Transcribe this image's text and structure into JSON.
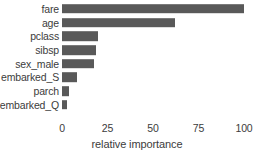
{
  "chart_data": {
    "type": "bar",
    "orientation": "horizontal",
    "title": "",
    "subtitle": "",
    "xlabel": "relative importance",
    "ylabel": "",
    "categories": [
      "fare",
      "age",
      "pclass",
      "sibsp",
      "sex_male",
      "embarked_S",
      "parch",
      "embarked_Q"
    ],
    "values": [
      100,
      62,
      20,
      18.5,
      17.5,
      8.5,
      4,
      3
    ],
    "series": [
      {
        "name": "relative importance",
        "values": [
          100,
          62,
          20,
          18.5,
          17.5,
          8.5,
          4,
          3
        ]
      }
    ],
    "xlim": [
      0,
      100
    ],
    "xticks": [
      0,
      25,
      50,
      75,
      100
    ],
    "xtick_labels": [
      "0",
      "25",
      "50",
      "75",
      "100"
    ],
    "grid": false,
    "legend": false,
    "legend_position": "none",
    "bar_color": "#595959",
    "text_color": "#3c3c3c",
    "background_color": "#ffffff",
    "annotations": []
  },
  "axis": {
    "x_title": "relative importance",
    "ticks": [
      {
        "label": "0",
        "value": 0
      },
      {
        "label": "25",
        "value": 25
      },
      {
        "label": "50",
        "value": 50
      },
      {
        "label": "75",
        "value": 75
      },
      {
        "label": "100",
        "value": 100
      }
    ]
  },
  "bars": [
    {
      "label": "fare",
      "value": 100
    },
    {
      "label": "age",
      "value": 62
    },
    {
      "label": "pclass",
      "value": 20
    },
    {
      "label": "sibsp",
      "value": 18.5
    },
    {
      "label": "sex_male",
      "value": 17.5
    },
    {
      "label": "embarked_S",
      "value": 8.5
    },
    {
      "label": "parch",
      "value": 4
    },
    {
      "label": "embarked_Q",
      "value": 3
    }
  ]
}
